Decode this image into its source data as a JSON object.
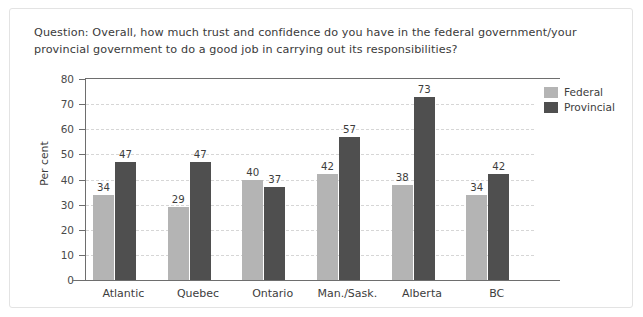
{
  "question": "Question: Overall, how much trust and confidence do you have in the federal government/your provincial government to do a good job in carrying out its responsibilities?",
  "legend": {
    "federal_label": "Federal",
    "provincial_label": "Provincial"
  },
  "colors": {
    "federal": "#b4b4b4",
    "provincial": "#4f4f4f",
    "axis": "#6e6e6e",
    "gridline": "#d6d6d6",
    "text": "#3d3d3d",
    "frame": "#e3e3e3"
  },
  "chart_data": {
    "type": "bar",
    "title": "",
    "subtitle": "",
    "xlabel": "",
    "ylabel": "Per cent",
    "ylim": [
      0,
      80
    ],
    "ytick_step": 10,
    "yticks": [
      0,
      10,
      20,
      30,
      40,
      50,
      60,
      70,
      80
    ],
    "ytick_labels": [
      "0",
      "10",
      "20",
      "30",
      "40",
      "50",
      "60",
      "70",
      "80"
    ],
    "grid": true,
    "grid_axis": "y",
    "legend_position": "top-right",
    "data_labels": true,
    "categories": [
      "Atlantic",
      "Quebec",
      "Ontario",
      "Man./Sask.",
      "Alberta",
      "BC"
    ],
    "series": [
      {
        "name": "Federal",
        "color": "#b4b4b4",
        "values": [
          34,
          29,
          40,
          42,
          38,
          34
        ]
      },
      {
        "name": "Provincial",
        "color": "#4f4f4f",
        "values": [
          47,
          47,
          37,
          57,
          73,
          42
        ]
      }
    ]
  }
}
